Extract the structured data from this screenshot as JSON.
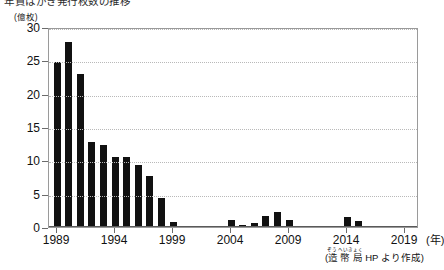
{
  "figure": {
    "title_partial": "年賀はがき発行枚数の推移",
    "source_note_prefix": "(",
    "source_note_ruby_base": "造幣局",
    "source_note_ruby_text": "ぞうへいきょく",
    "source_note_suffix": " HP より作成)",
    "x_unit_label": "(年)",
    "y_unit_label": "(億枚)"
  },
  "chart_data": {
    "type": "bar",
    "title": "年賀はがき発行枚数の推移",
    "xlabel": "(年)",
    "ylabel": "(億枚)",
    "xlim": [
      1988.3,
      2020.2
    ],
    "ylim": [
      0,
      30
    ],
    "grid": true,
    "legend": "none",
    "bar_color": "#111111",
    "yticks": [
      0,
      5,
      10,
      15,
      20,
      25,
      30
    ],
    "ytick_labels": [
      "0",
      "5",
      "10",
      "15",
      "20",
      "25",
      "30"
    ],
    "xticks": [
      1989,
      1994,
      1999,
      2004,
      2009,
      2014,
      2019
    ],
    "xtick_labels": [
      "1989",
      "1994",
      "1999",
      "2004",
      "2009",
      "2014",
      "2019"
    ],
    "categories": [
      1989,
      1990,
      1991,
      1992,
      1993,
      1994,
      1995,
      1996,
      1997,
      1998,
      1999,
      2000,
      2001,
      2002,
      2003,
      2004,
      2005,
      2006,
      2007,
      2008,
      2009,
      2010,
      2011,
      2012,
      2013,
      2014,
      2015,
      2016,
      2017,
      2018,
      2019
    ],
    "values": [
      24.7,
      27.7,
      23.0,
      12.8,
      12.3,
      10.5,
      10.5,
      9.3,
      7.6,
      4.3,
      0.7,
      0.1,
      0.0,
      0.0,
      0.0,
      1.0,
      0.3,
      0.6,
      1.6,
      2.2,
      1.0,
      0.1,
      0.0,
      0.0,
      0.0,
      1.5,
      0.9,
      0.0,
      0.0,
      0.0,
      0.0
    ],
    "source": "(造幣局 HP より作成)"
  }
}
